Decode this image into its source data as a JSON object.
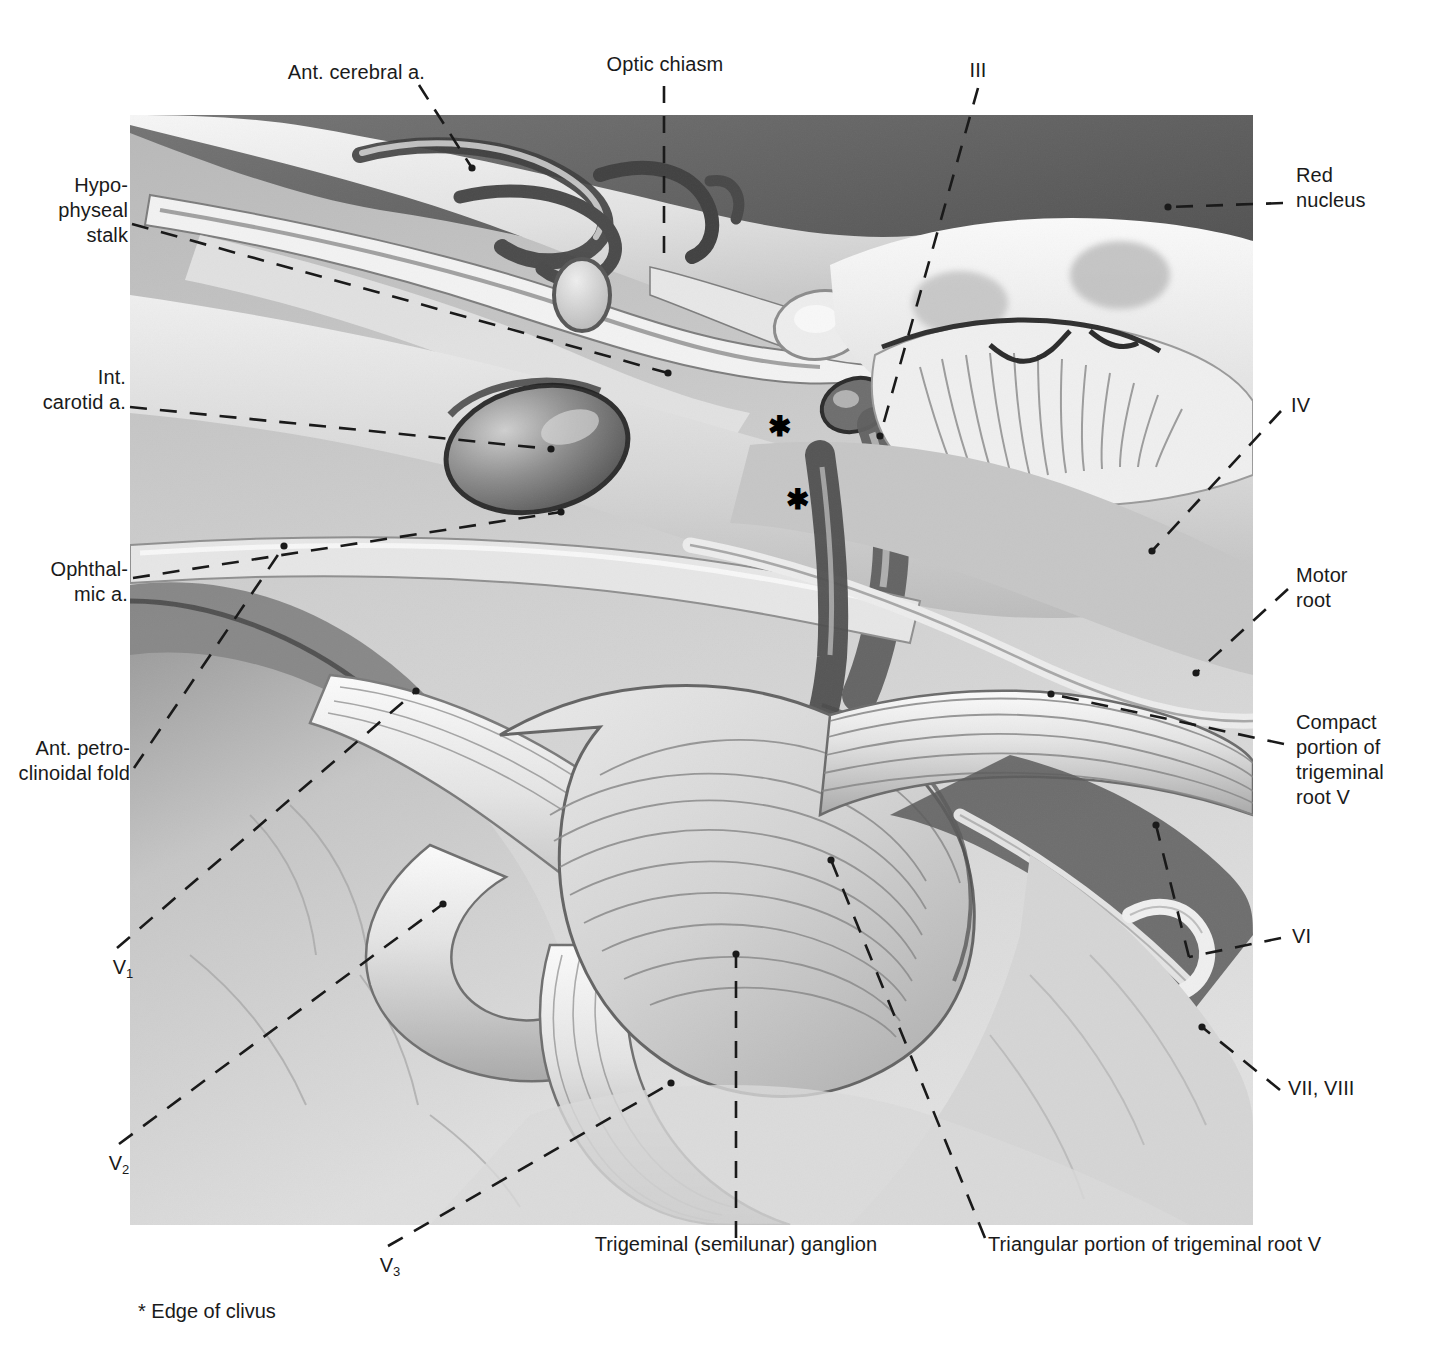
{
  "figure": {
    "footnote": "* Edge of clivus",
    "asterisk_glyph": "✱",
    "ink_color": "#1a1a1a",
    "plate_bg": "#ffffff"
  },
  "labels": {
    "ant_cerebral_a": "Ant. cerebral a.",
    "optic_chiasm": "Optic chiasm",
    "nerve_iii": "III",
    "red_nucleus": "Red\nnucleus",
    "hypophyseal_stalk": "Hypo-\nphyseal\nstalk",
    "int_carotid_a": "Int.\ncarotid a.",
    "nerve_iv": "IV",
    "ophthalmic_a": "Ophthal-\nmic a.",
    "motor_root": "Motor\nroot",
    "ant_petroclinoidal_fold": "Ant. petro-\nclinoidal fold",
    "compact_portion": "Compact\nportion of\ntrigeminal\nroot V",
    "v1_base": "V",
    "v1_sub": "1",
    "v2_base": "V",
    "v2_sub": "2",
    "v3_base": "V",
    "v3_sub": "3",
    "nerve_vi": "VI",
    "nerve_vii_viii": "VII, VIII",
    "trigeminal_ganglion": "Trigeminal (semilunar) ganglion",
    "triangular_portion": "Triangular portion of trigeminal root V"
  },
  "markers": {
    "asterisk_upper": "✱",
    "asterisk_lower": "✱"
  }
}
